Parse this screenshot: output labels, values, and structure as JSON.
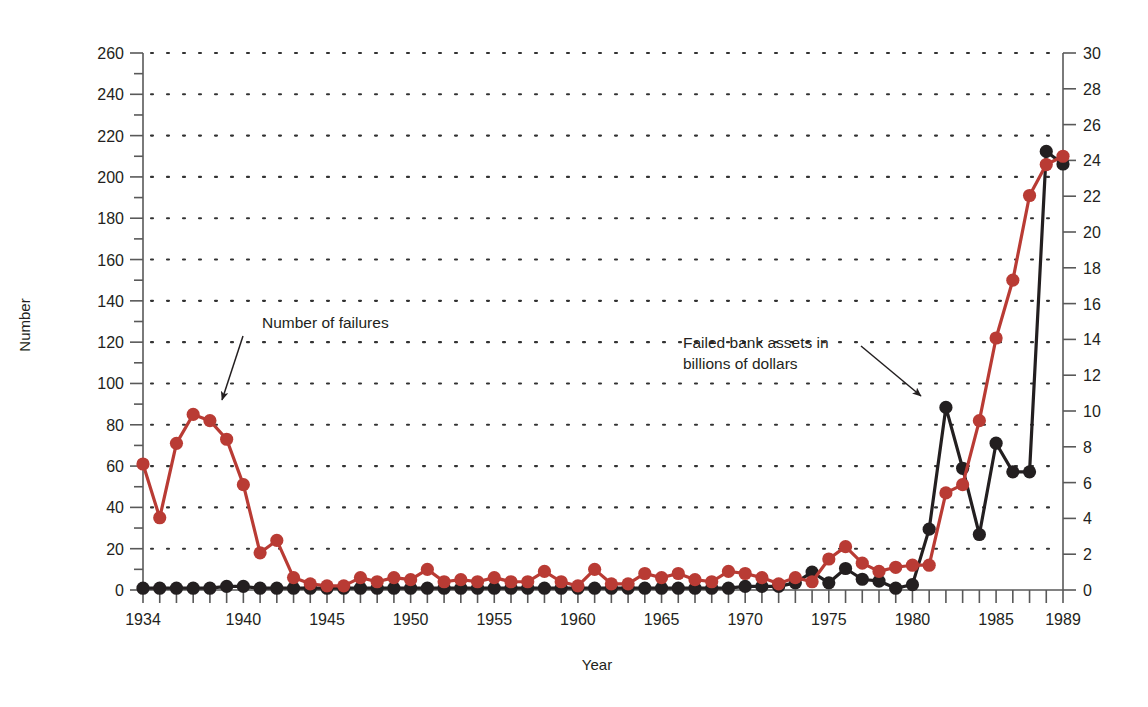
{
  "chart_data": {
    "type": "line",
    "title": "",
    "xlabel": "Year",
    "ylabel": "Number",
    "ylabel_right": "",
    "grid": true,
    "legend_position": "none",
    "xlim": [
      1934,
      1989
    ],
    "ylim": [
      0,
      260
    ],
    "ylim_right": [
      0,
      30
    ],
    "yticks": [
      0,
      20,
      40,
      60,
      80,
      100,
      120,
      140,
      160,
      180,
      200,
      220,
      240,
      260
    ],
    "yticks_right": [
      0,
      2,
      4,
      6,
      8,
      10,
      12,
      14,
      16,
      18,
      20,
      22,
      24,
      26,
      28,
      30
    ],
    "ytick_minor_step": 10,
    "xticks": [
      1934,
      1935,
      1936,
      1937,
      1938,
      1939,
      1940,
      1941,
      1942,
      1943,
      1944,
      1945,
      1946,
      1947,
      1948,
      1949,
      1950,
      1951,
      1952,
      1953,
      1954,
      1955,
      1956,
      1957,
      1958,
      1959,
      1960,
      1961,
      1962,
      1963,
      1964,
      1965,
      1966,
      1967,
      1968,
      1969,
      1970,
      1971,
      1972,
      1973,
      1974,
      1975,
      1976,
      1977,
      1978,
      1979,
      1980,
      1981,
      1982,
      1983,
      1984,
      1985,
      1986,
      1987,
      1988,
      1989
    ],
    "xtick_labels": [
      {
        "year": 1934,
        "label": "1934"
      },
      {
        "year": 1940,
        "label": "1940"
      },
      {
        "year": 1945,
        "label": "1945"
      },
      {
        "year": 1950,
        "label": "1950"
      },
      {
        "year": 1955,
        "label": "1955"
      },
      {
        "year": 1960,
        "label": "1960"
      },
      {
        "year": 1965,
        "label": "1965"
      },
      {
        "year": 1970,
        "label": "1970"
      },
      {
        "year": 1975,
        "label": "1975"
      },
      {
        "year": 1980,
        "label": "1980"
      },
      {
        "year": 1985,
        "label": "1985"
      },
      {
        "year": 1989,
        "label": "1989"
      }
    ],
    "x": [
      1934,
      1935,
      1936,
      1937,
      1938,
      1939,
      1940,
      1941,
      1942,
      1943,
      1944,
      1945,
      1946,
      1947,
      1948,
      1949,
      1950,
      1951,
      1952,
      1953,
      1954,
      1955,
      1956,
      1957,
      1958,
      1959,
      1960,
      1961,
      1962,
      1963,
      1964,
      1965,
      1966,
      1967,
      1968,
      1969,
      1970,
      1971,
      1972,
      1973,
      1974,
      1975,
      1976,
      1977,
      1978,
      1979,
      1980,
      1981,
      1982,
      1983,
      1984,
      1985,
      1986,
      1987,
      1988,
      1989
    ],
    "series": [
      {
        "name": "Number of failures",
        "color": "#b93b34",
        "axis": "left",
        "values": [
          61,
          35,
          71,
          85,
          82,
          73,
          51,
          18,
          24,
          6,
          3,
          2,
          2,
          6,
          4,
          6,
          5,
          10,
          4,
          5,
          4,
          6,
          4,
          4,
          9,
          4,
          2,
          10,
          3,
          3,
          8,
          6,
          8,
          5,
          4,
          9,
          8,
          6,
          3,
          6,
          4,
          15,
          21,
          13,
          9,
          11,
          12,
          12,
          47,
          51,
          82,
          122,
          150,
          191,
          206,
          210
        ]
      },
      {
        "name": "Failed bank assets in billions of dollars",
        "color": "#231f20",
        "axis": "right",
        "values": [
          0.1,
          0.1,
          0.1,
          0.1,
          0.1,
          0.2,
          0.2,
          0.1,
          0.1,
          0.1,
          0.1,
          0.1,
          0.1,
          0.1,
          0.1,
          0.1,
          0.1,
          0.1,
          0.1,
          0.1,
          0.1,
          0.1,
          0.1,
          0.1,
          0.1,
          0.1,
          0.1,
          0.1,
          0.1,
          0.1,
          0.1,
          0.1,
          0.1,
          0.1,
          0.1,
          0.1,
          0.2,
          0.2,
          0.2,
          0.4,
          1.0,
          0.4,
          1.2,
          0.6,
          0.5,
          0.1,
          0.3,
          3.4,
          10.2,
          6.8,
          3.1,
          8.2,
          6.6,
          6.6,
          24.5,
          23.8
        ]
      }
    ],
    "annotations": [
      {
        "id": "number-of-failures",
        "text": "Number of failures",
        "text_lines": [
          "Number of failures"
        ],
        "target_year": 1937,
        "target_axis": "left",
        "target_value": 85
      },
      {
        "id": "failed-bank-assets",
        "text": "Failed bank assets in billions of dollars",
        "text_lines": [
          "Failed bank assets in",
          "billions of dollars"
        ],
        "target_year": 1982,
        "target_axis": "right",
        "target_value": 10.2
      }
    ]
  },
  "colors": {
    "red_series": "#b93b34",
    "black_series": "#231f20",
    "axis": "#595959",
    "grid_dot": "#333333",
    "background": "#ffffff"
  }
}
